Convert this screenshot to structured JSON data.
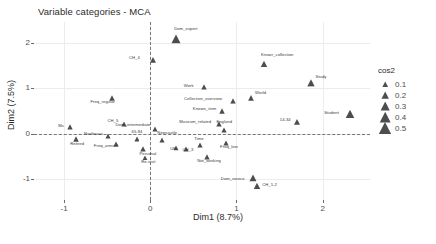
{
  "chart_data": {
    "type": "scatter",
    "title": "Variable categories - MCA",
    "xlabel": "Dim1 (8.7%)",
    "ylabel": "Dim2 (7.5%)",
    "xlim": [
      -1.35,
      2.55
    ],
    "ylim": [
      -1.45,
      2.45
    ],
    "xticks": [
      "-1",
      "0",
      "1",
      "2"
    ],
    "xtick_values": [
      -1,
      0,
      1,
      2
    ],
    "yticks": [
      "-1",
      "0",
      "1",
      "2"
    ],
    "ytick_values": [
      -1,
      0,
      1,
      2
    ],
    "grid": true,
    "zero_lines": true,
    "legend": {
      "title": "cos2",
      "position": "right",
      "entries": [
        {
          "label": "0.1",
          "size": 3.2
        },
        {
          "label": "0.2",
          "size": 4.2
        },
        {
          "label": "0.3",
          "size": 5.2
        },
        {
          "label": "0.4",
          "size": 6.2
        },
        {
          "label": "0.5",
          "size": 7.2
        }
      ]
    },
    "marker_shape": "triangle",
    "marker_color": "#4d4d4d",
    "points": [
      {
        "label": "Dom_expert",
        "x": 0.3,
        "y": 2.08,
        "cos2": 0.42,
        "lx": -2,
        "ly": -8
      },
      {
        "label": "CH_4",
        "x": 0.03,
        "y": 1.62,
        "cos2": 0.18,
        "lx": -24,
        "ly": 0
      },
      {
        "label": "Work",
        "x": 0.62,
        "y": 1.02,
        "cos2": 0.14,
        "lx": -20,
        "ly": 1
      },
      {
        "label": "Knowr_collection",
        "x": 1.32,
        "y": 1.52,
        "cos2": 0.22,
        "lx": -3,
        "ly": -7
      },
      {
        "label": "Study",
        "x": 1.86,
        "y": 1.12,
        "cos2": 0.3,
        "lx": 5,
        "ly": -4
      },
      {
        "label": "Student",
        "x": 2.32,
        "y": 0.44,
        "cos2": 0.38,
        "lx": -26,
        "ly": 1
      },
      {
        "label": "Collection_overview",
        "x": 0.96,
        "y": 0.73,
        "cos2": 0.16,
        "lx": -49,
        "ly": 0
      },
      {
        "label": "World",
        "x": 1.17,
        "y": 0.78,
        "cos2": 0.17,
        "lx": 4,
        "ly": -3
      },
      {
        "label": "Known_item",
        "x": 0.83,
        "y": 0.5,
        "cos2": 0.15,
        "lx": -29,
        "ly": 0
      },
      {
        "label": "14-34",
        "x": 1.7,
        "y": 0.25,
        "cos2": 0.19,
        "lx": -17,
        "ly": 0
      },
      {
        "label": "Museum_related",
        "x": 0.8,
        "y": 0.22,
        "cos2": 0.14,
        "lx": -40,
        "ly": 0
      },
      {
        "label": "England",
        "x": 0.86,
        "y": 0.08,
        "cos2": 0.13,
        "lx": -8,
        "ly": -6
      },
      {
        "label": "Freq_low",
        "x": 0.88,
        "y": -0.2,
        "cos2": 0.13,
        "lx": -6,
        "ly": 6
      },
      {
        "label": "Freq_regular",
        "x": -0.44,
        "y": 0.78,
        "cos2": 0.16,
        "lx": -22,
        "ly": 6
      },
      {
        "label": "CH_5",
        "x": -0.3,
        "y": 0.22,
        "cos2": 0.13,
        "lx": -17,
        "ly": -1
      },
      {
        "label": "Dom_intermediate",
        "x": 0.06,
        "y": 0.1,
        "cos2": 0.12,
        "lx": -40,
        "ly": -2
      },
      {
        "label": "Ms",
        "x": -0.93,
        "y": 0.14,
        "cos2": 0.14,
        "lx": -12,
        "ly": 1
      },
      {
        "label": "Retired",
        "x": -0.86,
        "y": -0.11,
        "cos2": 0.15,
        "lx": -6,
        "ly": 7
      },
      {
        "label": "Northeast",
        "x": -0.49,
        "y": -0.05,
        "cos2": 0.12,
        "lx": -24,
        "ly": 0
      },
      {
        "label": "Freq_annual",
        "x": -0.4,
        "y": -0.22,
        "cos2": 0.13,
        "lx": -22,
        "ly": 4
      },
      {
        "label": "65-84",
        "x": -0.16,
        "y": -0.11,
        "cos2": 0.12,
        "lx": -5,
        "ly": -5
      },
      {
        "label": "Personal",
        "x": -0.08,
        "y": -0.33,
        "cos2": 0.14,
        "lx": -4,
        "ly": 7
      },
      {
        "label": "Re-visit",
        "x": -0.06,
        "y": -0.52,
        "cos2": 0.13,
        "lx": -4,
        "ly": 6
      },
      {
        "label": "Newcastle",
        "x": 0.14,
        "y": -0.14,
        "cos2": 0.12,
        "lx": -5,
        "ly": -5
      },
      {
        "label": "UK",
        "x": 0.3,
        "y": -0.32,
        "cos2": 0.11,
        "lx": -6,
        "ly": 3
      },
      {
        "label": "CH_3",
        "x": 0.42,
        "y": -0.33,
        "cos2": 0.12,
        "lx": -4,
        "ly": 3
      },
      {
        "label": "Time",
        "x": 0.58,
        "y": -0.25,
        "cos2": 0.13,
        "lx": -6,
        "ly": -4
      },
      {
        "label": "Not_working",
        "x": 0.66,
        "y": -0.5,
        "cos2": 0.14,
        "lx": -10,
        "ly": 6
      },
      {
        "label": "Dom_novice",
        "x": 1.19,
        "y": -0.96,
        "cos2": 0.26,
        "lx": -32,
        "ly": 3
      },
      {
        "label": "CH_1-2",
        "x": 1.24,
        "y": -1.14,
        "cos2": 0.24,
        "lx": 5,
        "ly": 1
      }
    ]
  }
}
